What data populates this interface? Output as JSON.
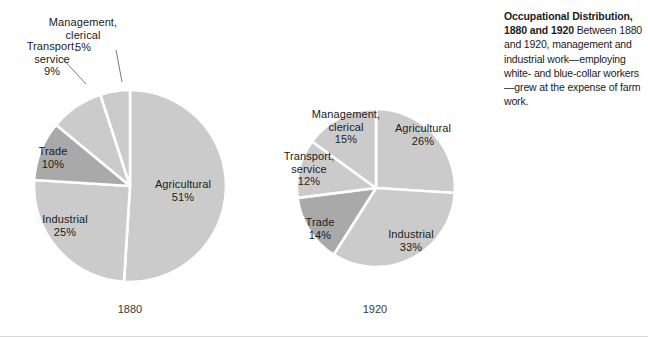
{
  "figure": {
    "caption_title": "Occupational Distribution, 1880 and 1920",
    "caption_body": " Between 1880 and 1920, management and industrial work—employing white- and blue-collar workers—grew at the expense of farm work."
  },
  "colors": {
    "slice_light": "#cbcbcb",
    "slice_dark": "#a9a9a9",
    "separator": "#ffffff",
    "text": "#1b1b1b",
    "leader_line": "#6a6a6a"
  },
  "charts": [
    {
      "id": "pie-1880",
      "year_label": "1880",
      "slices": [
        {
          "name": "Agricultural",
          "name_line1": "Agricultural",
          "name_line2": "",
          "percent": 51,
          "percent_label": "51%",
          "tone": "light"
        },
        {
          "name": "Industrial",
          "name_line1": "Industrial",
          "name_line2": "",
          "percent": 25,
          "percent_label": "25%",
          "tone": "light"
        },
        {
          "name": "Trade",
          "name_line1": "Trade",
          "name_line2": "",
          "percent": 10,
          "percent_label": "10%",
          "tone": "dark"
        },
        {
          "name": "Transport, service",
          "name_line1": "Transport,",
          "name_line2": "service",
          "percent": 9,
          "percent_label": "9%",
          "tone": "light"
        },
        {
          "name": "Management, clerical",
          "name_line1": "Management,",
          "name_line2": "clerical",
          "percent": 5,
          "percent_label": "5%",
          "tone": "light"
        }
      ]
    },
    {
      "id": "pie-1920",
      "year_label": "1920",
      "slices": [
        {
          "name": "Agricultural",
          "name_line1": "Agricultural",
          "name_line2": "",
          "percent": 26,
          "percent_label": "26%",
          "tone": "light"
        },
        {
          "name": "Industrial",
          "name_line1": "Industrial",
          "name_line2": "",
          "percent": 33,
          "percent_label": "33%",
          "tone": "light"
        },
        {
          "name": "Trade",
          "name_line1": "Trade",
          "name_line2": "",
          "percent": 14,
          "percent_label": "14%",
          "tone": "dark"
        },
        {
          "name": "Transport, service",
          "name_line1": "Transport,",
          "name_line2": "service",
          "percent": 12,
          "percent_label": "12%",
          "tone": "light"
        },
        {
          "name": "Management, clerical",
          "name_line1": "Management,",
          "name_line2": "clerical",
          "percent": 15,
          "percent_label": "15%",
          "tone": "light"
        }
      ]
    }
  ],
  "chart_data": {
    "type": "pie",
    "title": "Occupational Distribution, 1880 and 1920",
    "xlabel": "",
    "ylabel": "",
    "legend": "none (slices labeled directly)",
    "units": "percent of workforce",
    "categories": [
      "Agricultural",
      "Industrial",
      "Trade",
      "Transport, service",
      "Management, clerical"
    ],
    "series": [
      {
        "name": "1880",
        "values": [
          51,
          25,
          10,
          9,
          5
        ]
      },
      {
        "name": "1920",
        "values": [
          26,
          33,
          14,
          12,
          15
        ]
      }
    ],
    "annotations": [
      "Occupational Distribution, 1880 and 1920",
      "Between 1880 and 1920, management and industrial work—employing white- and blue-collar workers—grew at the expense of farm work."
    ]
  }
}
